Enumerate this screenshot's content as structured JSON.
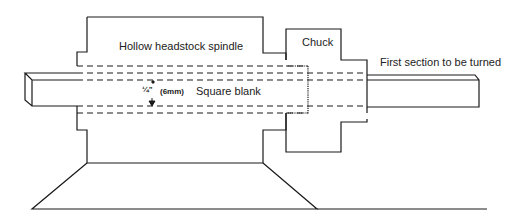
{
  "diagram": {
    "labels": {
      "spindle": "Hollow headstock spindle",
      "chuck": "Chuck",
      "first_section": "First section to be turned",
      "square_blank": "Square blank",
      "dimension_imperial": "¼\"",
      "dimension_metric": "(6mm)"
    },
    "colors": {
      "line": "#1a1a1a",
      "background": "#ffffff"
    }
  }
}
